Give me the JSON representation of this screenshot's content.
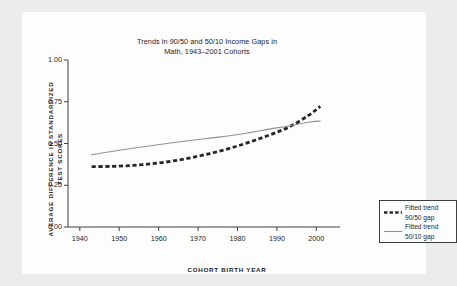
{
  "chart_data": {
    "type": "line",
    "title": "Trends in 90/50 and 50/10 Income Gaps in Math, 1943–2001 Cohorts",
    "title_line1": "Trends in 90/50 and 50/10 Income Gaps in",
    "title_line2": "Math, 1943–2001 Cohorts",
    "xlabel": "COHORT BIRTH YEAR",
    "ylabel": "AVERAGE DIFFERENCE IN STANDARDIZED TEST SCORES",
    "ylabel_line1": "AVERAGE DIFFERENCE IN STANDARDIZED",
    "ylabel_line2": "TEST SCORES",
    "xlim": [
      1937,
      2006
    ],
    "ylim": [
      0.0,
      1.0
    ],
    "xticks": [
      1940,
      1950,
      1960,
      1970,
      1980,
      1990,
      2000
    ],
    "xtick_labels": [
      "1940",
      "1950",
      "1960",
      "1970",
      "1980",
      "1990",
      "2000"
    ],
    "yticks": [
      0.0,
      0.25,
      0.5,
      0.75,
      1.0
    ],
    "ytick_labels": [
      "0.00",
      "0.25",
      "0.50",
      "0.75",
      "1.00"
    ],
    "grid": false,
    "legend_position": "lower right",
    "x": [
      1943,
      1948,
      1953,
      1958,
      1963,
      1968,
      1973,
      1978,
      1983,
      1988,
      1993,
      1998,
      2001
    ],
    "series": [
      {
        "name": "Fitted trend 90/50 gap",
        "name_line1": "Fitted trend",
        "name_line2": "90/50 gap",
        "style": "dashed",
        "color": "#24272c",
        "values": [
          0.362,
          0.363,
          0.368,
          0.378,
          0.393,
          0.414,
          0.44,
          0.471,
          0.508,
          0.55,
          0.598,
          0.668,
          0.722
        ]
      },
      {
        "name": "Fitted trend 50/10 gap",
        "name_line1": "Fitted trend",
        "name_line2": "50/10 gap",
        "style": "solid",
        "color": "#8e9195",
        "values": [
          0.432,
          0.452,
          0.47,
          0.487,
          0.503,
          0.518,
          0.532,
          0.546,
          0.565,
          0.586,
          0.605,
          0.627,
          0.635
        ]
      }
    ]
  },
  "colors": {
    "background": "#ececec",
    "panel": "#fdfdfd",
    "axis": "#3c3f44",
    "text": "#22262b",
    "dashed_series": "#24272c",
    "solid_series": "#8e9195"
  }
}
